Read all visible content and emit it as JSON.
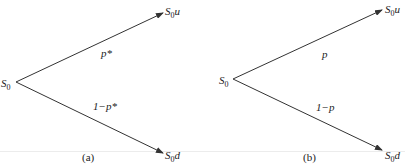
{
  "diagrams": [
    {
      "id": "a",
      "caption": "(a)",
      "root": {
        "main": "S",
        "sub": "0"
      },
      "up_node": {
        "main": "S",
        "sub": "0",
        "suffix": "u"
      },
      "down_node": {
        "main": "S",
        "sub": "0",
        "suffix": "d"
      },
      "up_prob": "p*",
      "down_prob": "1−p*"
    },
    {
      "id": "b",
      "caption": "(b)",
      "root": {
        "main": "S",
        "sub": "0"
      },
      "up_node": {
        "main": "S",
        "sub": "0",
        "suffix": "u"
      },
      "down_node": {
        "main": "S",
        "sub": "0",
        "suffix": "d"
      },
      "up_prob": "p",
      "down_prob": "1−p"
    }
  ],
  "colors": {
    "line": "#333333",
    "text": "#222222"
  }
}
